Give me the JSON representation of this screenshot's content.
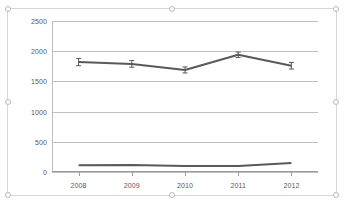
{
  "chart_data": {
    "type": "line",
    "title": "",
    "xlabel": "",
    "ylabel": "",
    "categories": [
      "2008",
      "2009",
      "2010",
      "2011",
      "2012"
    ],
    "ylim": [
      0,
      2500
    ],
    "yticks": [
      0,
      500,
      1000,
      1500,
      2000,
      2500
    ],
    "ytick_labels": [
      "0",
      "500",
      "1000",
      "1500",
      "2000",
      "2500"
    ],
    "grid": true,
    "legend": "none",
    "series": [
      {
        "name": "upper-series",
        "color": "#595959",
        "values": [
          1820,
          1790,
          1690,
          1940,
          1760
        ],
        "error_bars": [
          60,
          55,
          50,
          45,
          55
        ]
      },
      {
        "name": "lower-series",
        "color": "#595959",
        "values": [
          110,
          115,
          100,
          100,
          150
        ],
        "error_bars": [
          0,
          0,
          0,
          0,
          0
        ]
      }
    ]
  },
  "chart_object": {
    "name": "chart-object",
    "selected": true,
    "handles": [
      "top-left",
      "top-center",
      "top-right",
      "middle-left",
      "middle-right",
      "bottom-left",
      "bottom-center",
      "bottom-right"
    ]
  }
}
